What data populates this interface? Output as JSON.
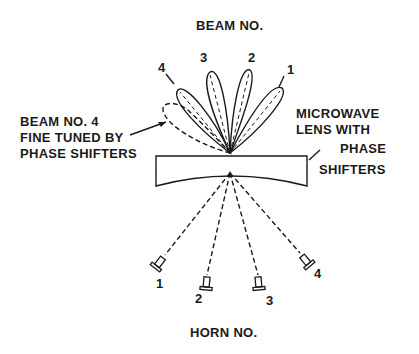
{
  "title": "BEAM NO.",
  "footer": "HORN NO.",
  "beam_labels": [
    "1",
    "2",
    "3",
    "4"
  ],
  "horn_labels": [
    "1",
    "2",
    "3",
    "4"
  ],
  "left_annotation": [
    "BEAM NO. 4",
    "FINE TUNED BY",
    "PHASE SHIFTERS"
  ],
  "right_annotation": [
    "MICROWAVE",
    "LENS WITH"
  ],
  "phase_annotation": [
    "PHASE",
    "SHIFTERS"
  ]
}
